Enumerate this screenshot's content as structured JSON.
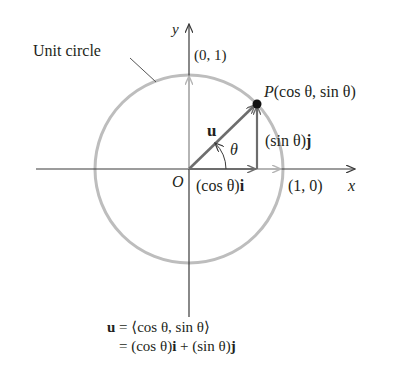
{
  "diagram": {
    "labels": {
      "unit_circle": "Unit circle",
      "y_axis": "y",
      "x_axis": "x",
      "origin": "O",
      "point_0_1": "(0, 1)",
      "point_1_0": "(1, 0)",
      "point_P_prefix": "P",
      "point_P_coords": "(cos θ, sin θ)",
      "vector_u": "u",
      "angle": "θ",
      "sin_component_prefix": "(sin θ)",
      "sin_component_unit": "j",
      "cos_component_prefix": "(cos θ)",
      "cos_component_unit": "i"
    },
    "equation": {
      "line1_lhs": "u",
      "line1_rhs": " = ⟨cos θ, sin θ⟩",
      "line2_a": "= (cos θ)",
      "line2_i": "i",
      "line2_b": " + (sin θ)",
      "line2_j": "j"
    },
    "colors": {
      "axis": "#3a3a3a",
      "circle": "#bdbdbd",
      "vector": "#6d6d6d",
      "light_vector": "#b5b5b5",
      "point": "#111111"
    }
  }
}
